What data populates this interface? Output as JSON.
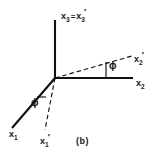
{
  "figure": {
    "caption": "(b)",
    "background_color": "#ffffff",
    "stroke_color": "#111111",
    "labels": {
      "x3": {
        "base": "x",
        "sub": "3",
        "equals": "=",
        "base2": "x",
        "sub2": "3",
        "prime2": "′",
        "full": "x3 = x3′"
      },
      "x2": {
        "base": "x",
        "sub": "2",
        "full": "x2"
      },
      "x2p": {
        "base": "x",
        "sub": "2",
        "prime": "′",
        "full": "x2′"
      },
      "x1": {
        "base": "x",
        "sub": "1",
        "full": "x1"
      },
      "x1p": {
        "base": "x",
        "sub": "1",
        "prime": "′",
        "full": "x1′"
      }
    },
    "angles": {
      "right": {
        "symbol": "ϕ",
        "name": "phi"
      },
      "left": {
        "symbol": "ϕ",
        "name": "phi"
      }
    },
    "geometry": {
      "origin": [
        55,
        78
      ],
      "x3_axis_end": [
        55,
        20
      ],
      "x2_axis_end": [
        133,
        78
      ],
      "x2_prime_end": [
        132,
        57
      ],
      "x1_axis_end": [
        12,
        128
      ],
      "x1_prime_end": [
        45,
        129
      ]
    }
  }
}
